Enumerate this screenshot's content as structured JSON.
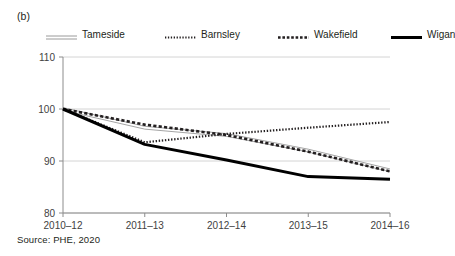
{
  "figure": {
    "panel_label": "(b)",
    "source_note": "Source: PHE, 2020"
  },
  "legend": {
    "items": [
      {
        "label": "Tameside",
        "style": "double-thin-line",
        "color": "#9a9a9a"
      },
      {
        "label": "Barnsley",
        "style": "fine-dotted-line",
        "color": "#231f20"
      },
      {
        "label": "Wakefield",
        "style": "dashed-line",
        "color": "#231f20"
      },
      {
        "label": "Wigan",
        "style": "thick-solid-line",
        "color": "#000000"
      }
    ]
  },
  "chart_data": {
    "type": "line",
    "title": "",
    "subtitle": "",
    "xlabel": "",
    "ylabel": "",
    "categories": [
      "2010–12",
      "2011–13",
      "2012–14",
      "2013–15",
      "2014–16"
    ],
    "yticks": [
      80,
      90,
      100,
      110
    ],
    "ylim": [
      80,
      110
    ],
    "grid": "horizontal",
    "legend_position": "top",
    "series": [
      {
        "name": "Tameside",
        "values": [
          100.0,
          96.4,
          95.0,
          92.0,
          88.2
        ],
        "color": "#9a9a9a",
        "style": "double-thin-line"
      },
      {
        "name": "Barnsley",
        "values": [
          100.0,
          93.6,
          95.2,
          96.4,
          97.5
        ],
        "color": "#231f20",
        "style": "fine-dotted-line"
      },
      {
        "name": "Wakefield",
        "values": [
          100.0,
          97.0,
          95.0,
          91.8,
          88.0
        ],
        "color": "#231f20",
        "style": "dashed-line"
      },
      {
        "name": "Wigan",
        "values": [
          100.0,
          93.2,
          90.2,
          87.0,
          86.5
        ],
        "color": "#000000",
        "style": "thick-solid-line"
      }
    ]
  }
}
